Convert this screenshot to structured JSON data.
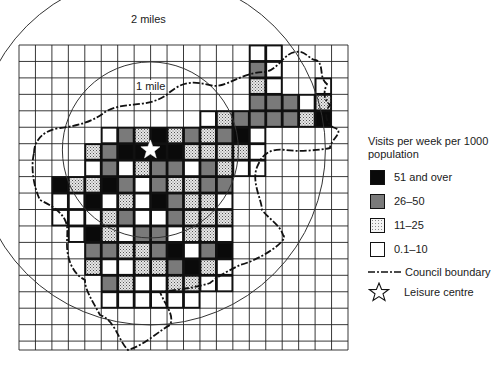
{
  "figure": {
    "ring_labels": {
      "outer": "2 miles",
      "inner": "1 mile"
    },
    "legend": {
      "title": "Visits per week per 1000 population",
      "items": [
        {
          "label": "51 and over",
          "level": 4,
          "fill": "#0a0a0a"
        },
        {
          "label": "26–50",
          "level": 3,
          "fill": "#7a7a7a"
        },
        {
          "label": "11–25",
          "level": 2,
          "fill": "#d9d9d9",
          "pattern": "stipple"
        },
        {
          "label": "0.1–10",
          "level": 1,
          "fill": "#ffffff"
        }
      ],
      "boundary_label": "Council boundary",
      "centre_label": "Leisure centre"
    }
  },
  "chart_data": {
    "type": "heatmap",
    "title": "",
    "legend_title": "Visits per week per 1000 population",
    "classes": [
      "none",
      "0.1–10",
      "11–25",
      "26–50",
      "51 and over"
    ],
    "grid": {
      "cols": 20,
      "rows": 18,
      "origin_px": [
        19,
        45
      ],
      "cell_px": 16.45
    },
    "cells": [
      [
        0,
        0,
        0,
        0,
        0,
        0,
        0,
        0,
        0,
        0,
        0,
        0,
        0,
        0,
        1,
        1,
        0,
        0,
        0,
        0
      ],
      [
        0,
        0,
        0,
        0,
        0,
        0,
        0,
        0,
        0,
        0,
        0,
        0,
        0,
        0,
        3,
        1,
        0,
        0,
        0,
        0
      ],
      [
        0,
        0,
        0,
        0,
        0,
        0,
        0,
        0,
        0,
        0,
        0,
        0,
        0,
        0,
        2,
        1,
        0,
        0,
        1,
        0
      ],
      [
        0,
        0,
        0,
        0,
        0,
        0,
        0,
        0,
        0,
        0,
        0,
        0,
        0,
        0,
        3,
        3,
        3,
        1,
        2,
        0
      ],
      [
        0,
        0,
        0,
        0,
        0,
        0,
        0,
        0,
        0,
        0,
        0,
        1,
        2,
        3,
        3,
        3,
        3,
        2,
        4,
        0
      ],
      [
        0,
        0,
        0,
        0,
        0,
        1,
        3,
        2,
        4,
        2,
        3,
        2,
        3,
        4,
        1,
        0,
        0,
        0,
        0,
        0
      ],
      [
        0,
        0,
        0,
        0,
        2,
        3,
        4,
        4,
        4,
        4,
        2,
        2,
        2,
        2,
        1,
        0,
        0,
        0,
        0,
        0
      ],
      [
        0,
        0,
        0,
        0,
        1,
        3,
        1,
        2,
        3,
        3,
        1,
        3,
        2,
        1,
        1,
        0,
        0,
        0,
        0,
        0
      ],
      [
        0,
        0,
        4,
        2,
        2,
        4,
        3,
        1,
        3,
        2,
        2,
        3,
        3,
        0,
        0,
        0,
        0,
        0,
        0,
        0
      ],
      [
        0,
        0,
        1,
        1,
        4,
        1,
        2,
        1,
        4,
        3,
        2,
        2,
        1,
        0,
        0,
        0,
        0,
        0,
        0,
        0
      ],
      [
        0,
        0,
        1,
        1,
        1,
        2,
        3,
        1,
        1,
        3,
        2,
        2,
        2,
        0,
        0,
        0,
        0,
        0,
        0,
        0
      ],
      [
        0,
        0,
        0,
        1,
        4,
        2,
        1,
        3,
        3,
        1,
        2,
        2,
        1,
        0,
        0,
        0,
        0,
        0,
        0,
        0
      ],
      [
        0,
        0,
        0,
        0,
        3,
        3,
        2,
        2,
        3,
        4,
        1,
        3,
        4,
        0,
        0,
        0,
        0,
        0,
        0,
        0
      ],
      [
        0,
        0,
        0,
        0,
        2,
        1,
        1,
        2,
        2,
        3,
        4,
        2,
        1,
        0,
        0,
        0,
        0,
        0,
        0,
        0
      ],
      [
        0,
        0,
        0,
        0,
        0,
        3,
        2,
        1,
        1,
        2,
        2,
        1,
        1,
        0,
        0,
        0,
        0,
        0,
        0,
        0
      ],
      [
        0,
        0,
        0,
        0,
        0,
        1,
        1,
        1,
        1,
        1,
        1,
        0,
        0,
        0,
        0,
        0,
        0,
        0,
        0,
        0
      ],
      [
        0,
        0,
        0,
        0,
        0,
        0,
        0,
        0,
        0,
        0,
        0,
        0,
        0,
        0,
        0,
        0,
        0,
        0,
        0,
        0
      ],
      [
        0,
        0,
        0,
        0,
        0,
        0,
        0,
        0,
        0,
        0,
        0,
        0,
        0,
        0,
        0,
        0,
        0,
        0,
        0,
        0
      ]
    ],
    "leisure_centre_cell": [
      6,
      7
    ],
    "rings": [
      {
        "label": "1 mile",
        "radius_px": 88
      },
      {
        "label": "2 miles",
        "radius_px": 175
      }
    ],
    "annotations": [
      "2 miles",
      "1 mile",
      "Council boundary",
      "Leisure centre"
    ]
  }
}
